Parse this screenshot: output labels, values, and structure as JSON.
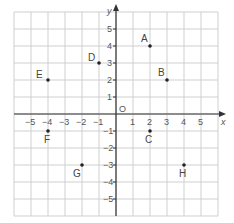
{
  "chart_data": {
    "type": "scatter",
    "title": "",
    "xlabel": "x",
    "ylabel": "y",
    "xlim": [
      -6,
      6
    ],
    "ylim": [
      -6,
      6
    ],
    "grid": true,
    "origin_label": "O",
    "x_ticks": [
      -5,
      -4,
      -3,
      -2,
      -1,
      1,
      2,
      3,
      4,
      5
    ],
    "y_ticks": [
      -5,
      -4,
      -3,
      -2,
      -1,
      1,
      2,
      3,
      4,
      5
    ],
    "points": [
      {
        "label": "A",
        "x": 2,
        "y": 4
      },
      {
        "label": "B",
        "x": 3,
        "y": 2
      },
      {
        "label": "C",
        "x": 2,
        "y": -1
      },
      {
        "label": "D",
        "x": -1,
        "y": 3
      },
      {
        "label": "E",
        "x": -4,
        "y": 2
      },
      {
        "label": "F",
        "x": -4,
        "y": -1
      },
      {
        "label": "G",
        "x": -2,
        "y": -3
      },
      {
        "label": "H",
        "x": 4,
        "y": -3
      }
    ]
  },
  "colors": {
    "grid": "#cfcfcf",
    "axis": "#333333",
    "point": "#222222",
    "text": "#555555"
  }
}
